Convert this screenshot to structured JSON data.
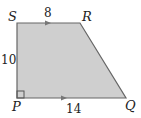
{
  "figure": {
    "shape": "right trapezoid",
    "fill_color": "#cfcfcf",
    "stroke_color": "#666666",
    "vertices": {
      "S": {
        "label": "S",
        "x": 17,
        "y": 23
      },
      "R": {
        "label": "R",
        "x": 80,
        "y": 23
      },
      "Q": {
        "label": "Q",
        "x": 126,
        "y": 98
      },
      "P": {
        "label": "P",
        "x": 17,
        "y": 98
      }
    },
    "sides": {
      "SR": {
        "label": "8"
      },
      "SP": {
        "label": "10"
      },
      "PQ": {
        "label": "14"
      }
    },
    "right_angle_at": "P",
    "parallel_marks": [
      "SR",
      "PQ"
    ]
  }
}
